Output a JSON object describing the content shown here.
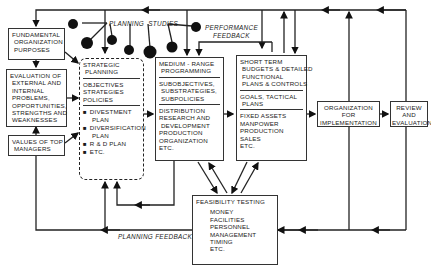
{
  "diagram": {
    "fundamental": {
      "lines": [
        "FUNDAMENTAL",
        " ORGANIZATION",
        " PURPOSES"
      ]
    },
    "evaluation": {
      "lines": [
        "EVALUATION OF",
        " EXTERNAL AND",
        " INTERNAL",
        " PROBLEMS,",
        " OPPORTUNITIES,",
        " STRENGTHS AND",
        " WEAKNESSES"
      ]
    },
    "values": {
      "lines": [
        "VALUES OF TOP",
        " MANAGERS"
      ]
    },
    "strategic": {
      "title": [
        "STRATEGIC",
        " PLANNING"
      ],
      "items": [
        "OBJECTIVES",
        "STRATEGIES",
        "POLICIES"
      ],
      "bullets": [
        "DIVESTMENT",
        "PLAN",
        "DIVERSIFICATION",
        "PLAN",
        "R & D PLAN",
        "ETC."
      ]
    },
    "medium": {
      "title": [
        "MEDIUM - RANGE",
        " PROGRAMMING"
      ],
      "sub": [
        "SUBOBJECTIVES,",
        " SUBSTRATEGIES,",
        " SUBPOLICIES"
      ],
      "items": [
        "DISTRIBUTION",
        "RESEARCH AND",
        " DEVELOPMENT",
        "PRODUCTION",
        "ORGANIZATION",
        "ETC."
      ]
    },
    "short": {
      "title": [
        "SHORT TERM",
        " BUDGETS & DETAILED",
        " FUNCTIONAL",
        " PLANS & CONTROLS"
      ],
      "goals": [
        "GOALS, TACTICAL",
        " PLANS"
      ],
      "items": [
        "FIXED ASSETS",
        "MANPOWER",
        "PRODUCTION",
        "SALES",
        "ETC."
      ]
    },
    "organization": {
      "lines": [
        "ORGANIZATION",
        "FOR",
        "IMPLEMENTATION"
      ]
    },
    "review": {
      "lines": [
        "REVIEW",
        "AND",
        "EVALUATION"
      ]
    },
    "feasibility": {
      "title": "FEASIBILITY TESTING",
      "items": [
        "MONEY",
        "FACILITIES",
        "PERSONNEL",
        "MANAGEMENT",
        "TIMING",
        "ETC."
      ]
    },
    "labels": {
      "planning_studies": "PLANNING  STUDIES",
      "performance_feedback_1": "PERFORMANCE",
      "performance_feedback_2": "FEEDBACK",
      "planning_feedback": "PLANNING FEEDBACK"
    }
  }
}
